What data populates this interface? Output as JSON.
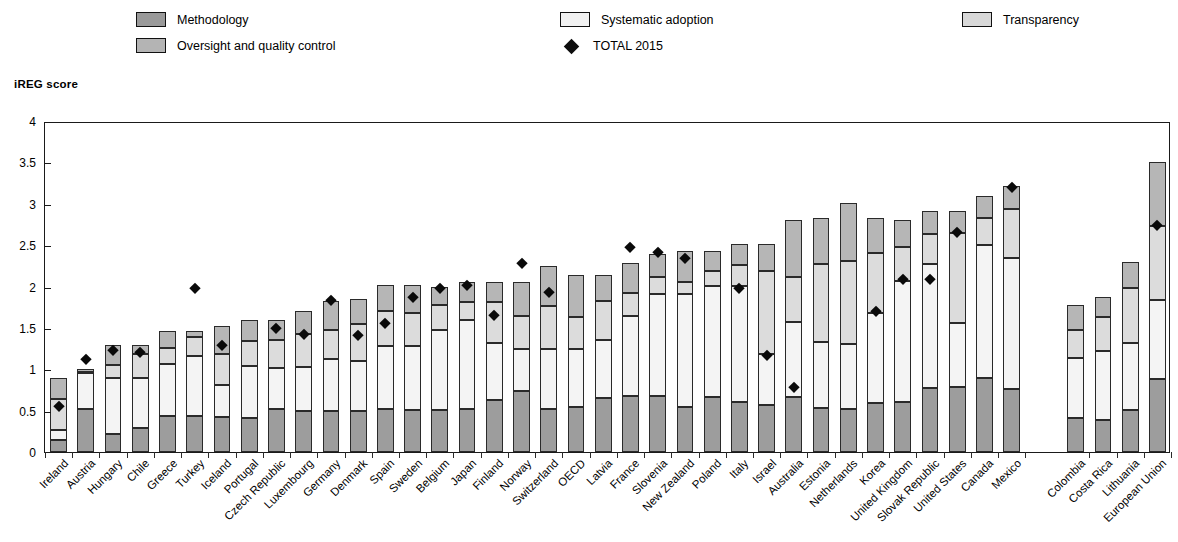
{
  "legend": {
    "items": [
      {
        "key": "methodology",
        "label": "Methodology",
        "swatch": "#9a9a9a",
        "icon": "square-swatch-icon"
      },
      {
        "key": "oversight",
        "label": "Oversight and quality control",
        "swatch": "#b4b4b4",
        "icon": "square-swatch-icon"
      },
      {
        "key": "systematic",
        "label": "Systematic adoption",
        "swatch": "#f1f1f1",
        "icon": "square-swatch-icon"
      },
      {
        "key": "transparency",
        "label": "Transparency",
        "swatch": "#d8d8d8",
        "icon": "square-swatch-icon"
      },
      {
        "key": "total2015",
        "label": "TOTAL 2015",
        "swatch": "#0d0d0d",
        "icon": "diamond-marker-icon"
      }
    ]
  },
  "axis_title": "iREG score",
  "chart_data": {
    "type": "bar",
    "title": "iREG score",
    "subtitle": "",
    "xlabel": "",
    "ylabel": "iREG score",
    "ylim": [
      0,
      4
    ],
    "yticks": [
      "0",
      "0.5",
      "1",
      "1.5",
      "2",
      "2.5",
      "3",
      "3.5",
      "4"
    ],
    "ytick_values": [
      0,
      0.5,
      1,
      1.5,
      2,
      2.5,
      3,
      3.5,
      4
    ],
    "grid": false,
    "stacked": true,
    "legend_position": "top",
    "stack_order_bottom_to_top": [
      "Methodology",
      "Systematic adoption",
      "Transparency",
      "Oversight and quality control"
    ],
    "series": [
      {
        "name": "Methodology",
        "color": "#9d9d9d",
        "values": [
          0.14,
          0.52,
          0.22,
          0.29,
          0.43,
          0.43,
          0.42,
          0.41,
          0.52,
          0.5,
          0.5,
          0.5,
          0.52,
          0.51,
          0.51,
          0.52,
          0.63,
          0.74,
          0.52,
          0.55,
          0.65,
          0.68,
          0.68,
          0.55,
          0.66,
          0.6,
          0.57,
          0.67,
          0.53,
          0.52,
          0.59,
          0.6,
          0.77,
          0.79,
          0.89,
          0.76,
          0.41,
          0.39,
          0.51,
          0.88
        ]
      },
      {
        "name": "Systematic adoption",
        "color": "#f4f4f4",
        "values": [
          0.13,
          0.43,
          0.68,
          0.61,
          0.63,
          0.73,
          0.39,
          0.63,
          0.5,
          0.53,
          0.62,
          0.6,
          0.76,
          0.77,
          0.97,
          1.07,
          0.69,
          0.5,
          0.73,
          0.7,
          0.7,
          0.96,
          1.23,
          1.36,
          1.35,
          1.41,
          0.62,
          0.9,
          0.8,
          0.79,
          1.09,
          1.47,
          1.5,
          0.77,
          1.61,
          1.58,
          0.73,
          0.83,
          0.81,
          0.96
        ]
      },
      {
        "name": "Transparency",
        "color": "#dcdcdc",
        "values": [
          0.37,
          0.02,
          0.15,
          0.28,
          0.2,
          0.23,
          0.38,
          0.3,
          0.33,
          0.4,
          0.35,
          0.45,
          0.42,
          0.4,
          0.3,
          0.22,
          0.49,
          0.4,
          0.52,
          0.38,
          0.47,
          0.28,
          0.2,
          0.15,
          0.18,
          0.25,
          1.0,
          0.55,
          0.94,
          1.0,
          0.72,
          0.41,
          0.37,
          1.09,
          0.33,
          0.6,
          0.33,
          0.41,
          0.66,
          0.89
        ]
      },
      {
        "name": "Oversight and quality control",
        "color": "#b6b6b6",
        "values": [
          0.26,
          0.03,
          0.24,
          0.11,
          0.2,
          0.07,
          0.33,
          0.26,
          0.25,
          0.28,
          0.35,
          0.3,
          0.32,
          0.34,
          0.22,
          0.24,
          0.24,
          0.41,
          0.48,
          0.51,
          0.32,
          0.37,
          0.28,
          0.37,
          0.24,
          0.25,
          0.32,
          0.68,
          0.56,
          0.7,
          0.43,
          0.32,
          0.27,
          0.26,
          0.27,
          0.28,
          0.31,
          0.24,
          0.32,
          0.77
        ]
      }
    ],
    "total_2015": [
      0.57,
      1.13,
      1.24,
      1.22,
      null,
      2.0,
      1.31,
      null,
      1.51,
      1.44,
      1.85,
      1.42,
      1.57,
      1.89,
      2.0,
      2.03,
      1.67,
      2.3,
      1.95,
      null,
      null,
      2.49,
      2.43,
      2.36,
      null,
      2.0,
      1.19,
      0.8,
      null,
      null,
      1.71,
      2.1,
      2.1,
      2.67,
      null,
      3.22,
      null,
      null,
      null,
      2.76
    ],
    "totals": [
      0.9,
      1.0,
      1.29,
      1.29,
      1.46,
      1.46,
      1.52,
      1.6,
      1.6,
      1.71,
      1.82,
      1.85,
      2.02,
      2.02,
      2.0,
      2.05,
      2.05,
      2.05,
      2.25,
      2.14,
      2.14,
      2.29,
      2.39,
      2.43,
      2.43,
      2.51,
      2.51,
      2.8,
      2.83,
      3.01,
      2.83,
      2.8,
      2.91,
      2.91,
      3.1,
      3.22,
      1.78,
      1.87,
      2.3,
      3.5
    ],
    "categories": [
      "Ireland",
      "Austria",
      "Hungary",
      "Chile",
      "Greece",
      "Turkey",
      "Iceland",
      "Portugal",
      "Czech Republic",
      "Luxembourg",
      "Germany",
      "Denmark",
      "Spain",
      "Sweden",
      "Belgium",
      "Japan",
      "Finland",
      "Norway",
      "Switzerland",
      "OECD",
      "Latvia",
      "France",
      "Slovenia",
      "New Zealand",
      "Poland",
      "Italy",
      "Israel",
      "Australia",
      "Estonia",
      "Netherlands",
      "Korea",
      "United Kingdom",
      "Slovak Republic",
      "United States",
      "Canada",
      "Mexico",
      "Colombia",
      "Costa Rica",
      "Lithuania",
      "European Union"
    ],
    "gap_after_index": 35,
    "colors": {
      "methodology": "#9d9d9d",
      "systematic_adoption": "#f4f4f4",
      "transparency": "#dcdcdc",
      "oversight": "#b6b6b6",
      "total_marker": "#0a0a0a",
      "axis": "#1a1a1a"
    }
  }
}
